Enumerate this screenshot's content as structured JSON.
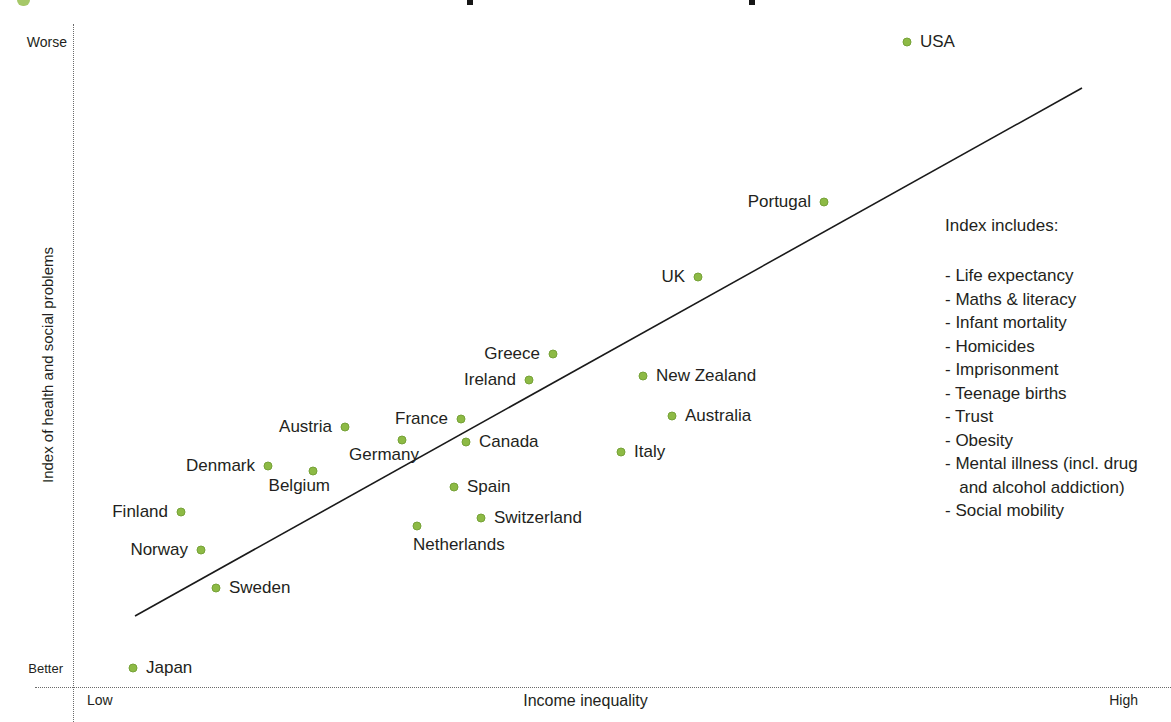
{
  "colors": {
    "dot_fill": "#8dba45",
    "dot_border": "#76a238",
    "trend_line": "#1a1a1a",
    "text": "#231f20",
    "axis_dotted": "#6b6b6b",
    "title_fragment_green": "#a6c868"
  },
  "axes": {
    "y_top_label": "Worse",
    "y_bottom_label": "Better",
    "y_title": "Index of health and social problems",
    "x_left_label": "Low",
    "x_title": "Income inequality",
    "x_right_label": "High"
  },
  "legend": {
    "title": "Index includes:",
    "items": [
      "- Life expectancy",
      "- Maths & literacy",
      "- Infant mortality",
      "- Homicides",
      "- Imprisonment",
      "- Teenage births",
      "- Trust",
      "- Obesity",
      "- Mental illness (incl. drug\n   and alcohol addiction)",
      "- Social mobility"
    ]
  },
  "chart_data": {
    "type": "scatter",
    "title": "",
    "xlabel": "Income inequality",
    "ylabel": "Index of health and social problems",
    "x_axis_range_labels": [
      "Low",
      "High"
    ],
    "y_axis_range_labels": [
      "Better",
      "Worse"
    ],
    "grid": false,
    "legend_position": "right",
    "plot_area_px": {
      "left": 73,
      "top": 25,
      "right": 1171,
      "bottom": 687
    },
    "trend_line_px": {
      "x1": 135,
      "y1": 616,
      "x2": 1082,
      "y2": 88
    },
    "points": [
      {
        "label": "USA",
        "x": 907,
        "y": 42,
        "side": "right"
      },
      {
        "label": "Portugal",
        "x": 824,
        "y": 202,
        "side": "left"
      },
      {
        "label": "UK",
        "x": 698,
        "y": 277,
        "side": "left"
      },
      {
        "label": "Greece",
        "x": 553,
        "y": 354,
        "side": "left"
      },
      {
        "label": "New Zealand",
        "x": 643,
        "y": 376,
        "side": "right"
      },
      {
        "label": "Ireland",
        "x": 529,
        "y": 380,
        "side": "left"
      },
      {
        "label": "Australia",
        "x": 672,
        "y": 416,
        "side": "right"
      },
      {
        "label": "France",
        "x": 461,
        "y": 419,
        "side": "left"
      },
      {
        "label": "Austria",
        "x": 345,
        "y": 427,
        "side": "left"
      },
      {
        "label": "Germany",
        "x": 402,
        "y": 440,
        "side": "below-left"
      },
      {
        "label": "Canada",
        "x": 466,
        "y": 442,
        "side": "right"
      },
      {
        "label": "Italy",
        "x": 621,
        "y": 452,
        "side": "right"
      },
      {
        "label": "Denmark",
        "x": 268,
        "y": 466,
        "side": "left"
      },
      {
        "label": "Belgium",
        "x": 313,
        "y": 471,
        "side": "below-left"
      },
      {
        "label": "Spain",
        "x": 454,
        "y": 487,
        "side": "right"
      },
      {
        "label": "Finland",
        "x": 181,
        "y": 512,
        "side": "left"
      },
      {
        "label": "Switzerland",
        "x": 481,
        "y": 518,
        "side": "right"
      },
      {
        "label": "Netherlands",
        "x": 417,
        "y": 526,
        "side": "below"
      },
      {
        "label": "Norway",
        "x": 201,
        "y": 550,
        "side": "left"
      },
      {
        "label": "Sweden",
        "x": 216,
        "y": 588,
        "side": "right"
      },
      {
        "label": "Japan",
        "x": 133,
        "y": 668,
        "side": "right"
      }
    ]
  }
}
